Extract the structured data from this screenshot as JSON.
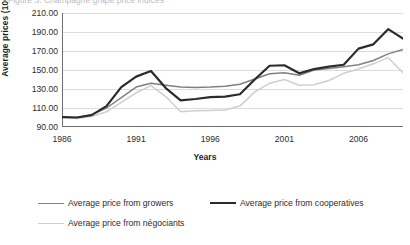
{
  "cut_title": "Figure 3. Champagne grape price indices",
  "axes": {
    "ylabel": "Average prices (100=1986)",
    "xlabel": "Years",
    "yticks": [
      "90.00",
      "110.00",
      "130.00",
      "150.00",
      "170.00",
      "190.00",
      "210.00"
    ],
    "xticks": [
      "1986",
      "1991",
      "1996",
      "2001",
      "2006"
    ]
  },
  "legend": {
    "items": [
      {
        "label": "Average price from growers",
        "color": "#808080",
        "width": 1.5
      },
      {
        "label": "Average price from cooperatives",
        "color": "#2b2b2b",
        "width": 2.2
      },
      {
        "label": "Average price from négociants",
        "color": "#cfcfcf",
        "width": 1.5
      }
    ]
  },
  "chart_data": {
    "type": "line",
    "title": "",
    "xlabel": "Years",
    "ylabel": "Average prices (100=1986)",
    "xlim": [
      1986,
      2009
    ],
    "ylim": [
      90,
      210
    ],
    "ytick_step": 20,
    "grid": true,
    "legend_position": "bottom",
    "x": [
      1986,
      1987,
      1988,
      1989,
      1990,
      1991,
      1992,
      1993,
      1994,
      1995,
      1996,
      1997,
      1998,
      1999,
      2000,
      2001,
      2002,
      2003,
      2004,
      2005,
      2006,
      2007,
      2008,
      2009
    ],
    "series": [
      {
        "name": "Average price from growers",
        "color": "#808080",
        "values": [
          100.5,
          100.0,
          103.0,
          110.0,
          121.0,
          132.0,
          136.0,
          134.0,
          132.0,
          131.5,
          132.0,
          133.0,
          135.0,
          140.5,
          146.0,
          147.0,
          144.5,
          150.0,
          151.5,
          153.5,
          155.5,
          160.0,
          167.0,
          171.5
        ]
      },
      {
        "name": "Average price from cooperatives",
        "color": "#2b2b2b",
        "values": [
          100.5,
          100.0,
          102.5,
          112.0,
          132.0,
          143.0,
          149.0,
          131.0,
          118.0,
          119.5,
          121.5,
          122.0,
          124.5,
          140.0,
          154.5,
          155.0,
          146.5,
          151.0,
          153.5,
          155.5,
          172.5,
          177.0,
          193.0,
          183.0
        ]
      },
      {
        "name": "Average price from négociants",
        "color": "#cfcfcf",
        "values": [
          100.5,
          99.0,
          101.0,
          106.0,
          116.0,
          126.0,
          133.5,
          122.0,
          106.0,
          107.0,
          107.5,
          108.0,
          112.0,
          127.0,
          136.0,
          140.0,
          134.0,
          134.5,
          139.0,
          146.5,
          151.0,
          156.5,
          163.0,
          147.0
        ]
      }
    ]
  }
}
